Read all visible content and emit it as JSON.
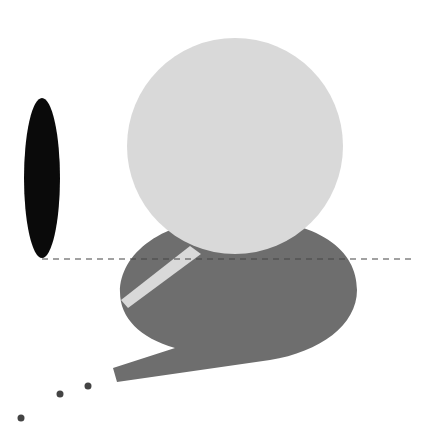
{
  "canvas": {
    "width": 428,
    "height": 443,
    "background": "#ffffff"
  },
  "colors": {
    "black_ellipse": "#0a0a0a",
    "light_circle": "#d9d9d9",
    "dark_bubble": "#6e6e6e",
    "stripe": "#d9d9d9",
    "dashed_line": "#444444",
    "dots": "#444444"
  },
  "shapes": {
    "black_ellipse": {
      "cx": 42,
      "cy": 178,
      "rx": 18,
      "ry": 80
    },
    "dashed_line": {
      "x1": 42,
      "y1": 259,
      "x2": 416,
      "y2": 259,
      "dash": "6 5"
    },
    "light_circle": {
      "cx": 235,
      "cy": 146,
      "r": 108
    },
    "dark_bubble": {
      "path": "M 357 290 C 357 250 320 220 238 218 C 160 218 120 255 120 292 C 120 318 140 338 175 348 L 113 368 L 117 382 L 270 360 C 320 352 357 325 357 290 Z"
    },
    "stripe": {
      "points": "190,246 201,254 128,308 121,300"
    },
    "dots": [
      {
        "cx": 21,
        "cy": 418,
        "r": 3.5
      },
      {
        "cx": 60,
        "cy": 394,
        "r": 3.5
      },
      {
        "cx": 88,
        "cy": 386,
        "r": 3.5
      }
    ]
  }
}
